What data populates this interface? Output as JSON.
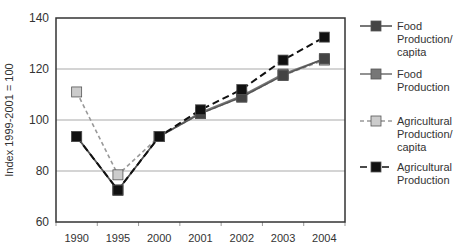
{
  "chart_data": {
    "type": "line",
    "title": "",
    "xlabel": "",
    "ylabel": "Index 1999-2001 = 100",
    "ylim": [
      60,
      140
    ],
    "yticks": [
      60,
      80,
      100,
      120,
      140
    ],
    "grid": true,
    "legend_position": "right",
    "categories": [
      "1990",
      "1995",
      "2000",
      "2001",
      "2002",
      "2003",
      "2004"
    ],
    "series": [
      {
        "name": "Food Production/ capita",
        "legend_lines": [
          "Food",
          "Production/",
          "capita"
        ],
        "values": [
          93.5,
          72.5,
          93.5,
          102.5,
          109,
          117.5,
          124
        ],
        "line_color": "#555555",
        "marker_color": "#444444",
        "dash": "solid"
      },
      {
        "name": "Food Production",
        "legend_lines": [
          "Food",
          "Production"
        ],
        "values": [
          93.5,
          72.5,
          93.5,
          103,
          109.5,
          118,
          124
        ],
        "line_color": "#777777",
        "marker_color": "#777777",
        "dash": "solid"
      },
      {
        "name": "Agricultural Production/ capita",
        "legend_lines": [
          "Agricultural",
          "Production/",
          "capita"
        ],
        "values": [
          111,
          78.5,
          93.5,
          102.5,
          109,
          117.5,
          123.5
        ],
        "line_color": "#999999",
        "marker_color": "#cccccc",
        "dash": "4,3"
      },
      {
        "name": "Agricultural Production",
        "legend_lines": [
          "Agricultural",
          "Production"
        ],
        "values": [
          93.5,
          72.5,
          93.5,
          104,
          112,
          123.5,
          132.5
        ],
        "line_color": "#111111",
        "marker_color": "#111111",
        "dash": "7,4"
      }
    ]
  }
}
